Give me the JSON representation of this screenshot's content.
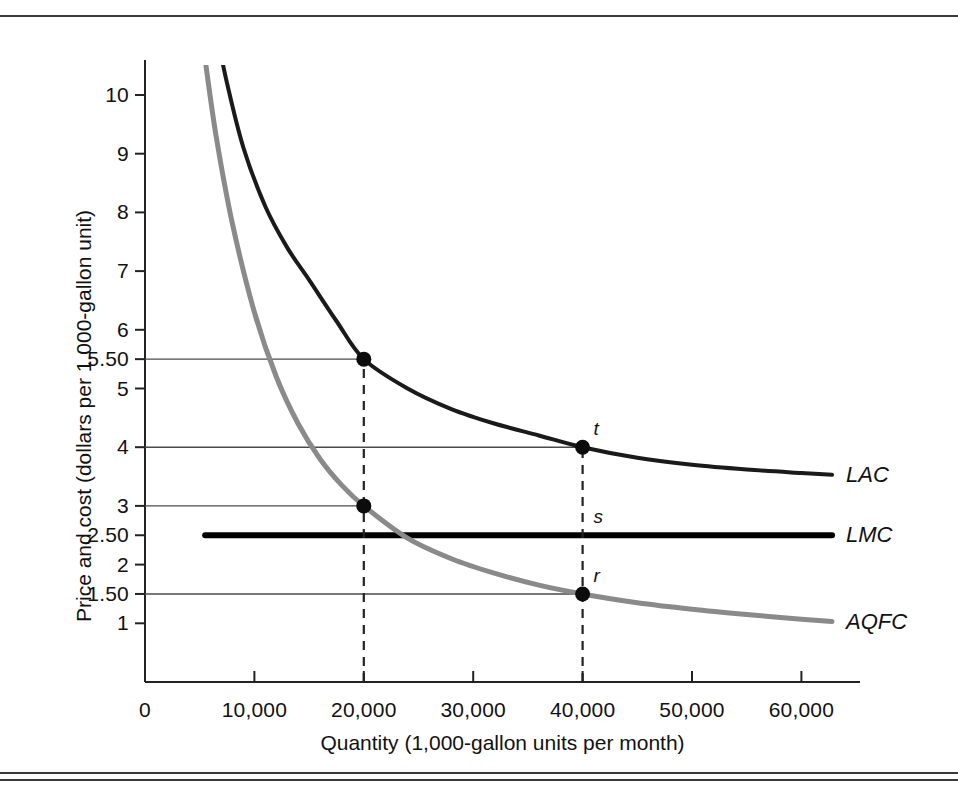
{
  "figure": {
    "background_color": "#ffffff",
    "rule_color": "#3a3a3a"
  },
  "chart_data": {
    "type": "line",
    "title": "",
    "xlabel": "Quantity (1,000-gallon units per month)",
    "ylabel": "Price and cost (dollars per 1,000-gallon unit)",
    "xlim": [
      0,
      63000
    ],
    "ylim": [
      0,
      11
    ],
    "grid": false,
    "legend_position": "right-of-curve-ends",
    "xticks": [
      0,
      10000,
      20000,
      30000,
      40000,
      50000,
      60000
    ],
    "xtick_labels": [
      "0",
      "10,000",
      "20,000",
      "30,000",
      "40,000",
      "50,000",
      "60,000"
    ],
    "yticks": [
      1,
      1.5,
      2,
      2.5,
      3,
      4,
      5,
      5.5,
      6,
      7,
      8,
      9,
      10
    ],
    "ytick_labels": [
      "1",
      "1.50",
      "2",
      "2.50",
      "3",
      "4",
      "5",
      "5.50",
      "6",
      "7",
      "8",
      "9",
      "10"
    ],
    "series": [
      {
        "name": "LAC",
        "label": "LAC",
        "color": "#1a1a1a",
        "width": 4,
        "style": "solid",
        "description": "Long-run average cost: declining convex curve approaching 3.50",
        "x": [
          6500,
          7500,
          9000,
          11000,
          13000,
          15000,
          17500,
          20000,
          24000,
          28000,
          32000,
          36000,
          40000,
          45000,
          50000,
          55000,
          60000,
          62800
        ],
        "y": [
          11.1,
          10.2,
          9.1,
          8.1,
          7.4,
          6.85,
          6.15,
          5.5,
          5.0,
          4.65,
          4.4,
          4.2,
          4.0,
          3.82,
          3.7,
          3.62,
          3.56,
          3.53
        ]
      },
      {
        "name": "LMC",
        "label": "LMC",
        "color": "#000000",
        "width": 6,
        "style": "solid",
        "description": "Long-run marginal cost: constant at 2.50",
        "x": [
          5500,
          62800
        ],
        "y": [
          2.5,
          2.5
        ]
      },
      {
        "name": "AQFC",
        "label": "AQFC",
        "color": "#8a8a8a",
        "width": 5,
        "style": "solid",
        "description": "Average quantity fee and cost: declining convex curve approaching 1.00",
        "x": [
          5500,
          6500,
          8000,
          10000,
          12000,
          14000,
          16000,
          18000,
          20000,
          24000,
          28000,
          32000,
          36000,
          40000,
          45000,
          50000,
          55000,
          60000,
          62800
        ],
        "y": [
          10.6,
          9.3,
          7.8,
          6.3,
          5.2,
          4.4,
          3.8,
          3.35,
          3.0,
          2.45,
          2.1,
          1.85,
          1.65,
          1.5,
          1.35,
          1.24,
          1.15,
          1.07,
          1.03
        ]
      }
    ],
    "points": [
      {
        "id": "p1",
        "label": "",
        "x": 20000,
        "y": 5.5,
        "series": "LAC"
      },
      {
        "id": "p2",
        "label": "",
        "x": 20000,
        "y": 3.0,
        "series": "AQFC"
      },
      {
        "id": "t",
        "label": "t",
        "x": 40000,
        "y": 4.0,
        "series": "LAC"
      },
      {
        "id": "r",
        "label": "r",
        "x": 40000,
        "y": 1.5,
        "series": "AQFC"
      }
    ],
    "annotations": [
      {
        "id": "s",
        "label": "s",
        "x": 40000,
        "y": 2.5,
        "note": "point on LMC at quantity 40,000"
      }
    ],
    "reference_lines": {
      "horizontal_from_axis": [
        {
          "y": 5.5,
          "to_x": 20000
        },
        {
          "y": 3.0,
          "to_x": 20000
        },
        {
          "y": 4.0,
          "to_x": 40000
        },
        {
          "y": 1.5,
          "to_x": 40000
        }
      ],
      "vertical_dashed": [
        {
          "x": 20000,
          "from_y": 0,
          "to_y": 5.5
        },
        {
          "x": 40000,
          "from_y": 0,
          "to_y": 4.0
        }
      ]
    }
  },
  "curve_labels": [
    {
      "text": "LAC",
      "anchor_x": 62800,
      "anchor_y": 3.53
    },
    {
      "text": "LMC",
      "anchor_x": 62800,
      "anchor_y": 2.5
    },
    {
      "text": "AQFC",
      "anchor_x": 62800,
      "anchor_y": 1.03
    }
  ]
}
